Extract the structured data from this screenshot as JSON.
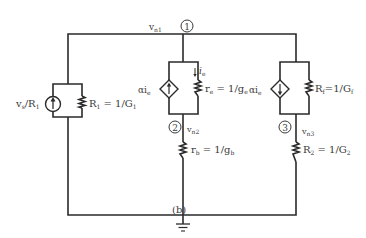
{
  "figure": {
    "caption": "(b)"
  },
  "nodes": [
    {
      "id": "1",
      "marker": "1",
      "voltage_label": "v",
      "voltage_sub": "n1"
    },
    {
      "id": "2",
      "marker": "2",
      "voltage_label": "v",
      "voltage_sub": "n2"
    },
    {
      "id": "3",
      "marker": "3",
      "voltage_label": "v",
      "voltage_sub": "n3"
    }
  ],
  "components": {
    "source_in": {
      "label": "v",
      "label_sub": "s",
      "label_rest": "/R",
      "label_rest_sub": "1"
    },
    "r1": {
      "label": "R",
      "label_sub": "1",
      "eq": " = 1/G",
      "eq_sub": "1"
    },
    "dep_source_mid": {
      "label": "αi",
      "label_sub": "e"
    },
    "re": {
      "label": "r",
      "label_sub": "e",
      "eq": " = 1/g",
      "eq_sub": "e"
    },
    "ie_current": {
      "label": "i",
      "label_sub": "e"
    },
    "rb": {
      "label": "r",
      "label_sub": "b",
      "eq": " = 1/g",
      "eq_sub": "b"
    },
    "dep_source_right": {
      "label": "αi",
      "label_sub": "e"
    },
    "rf": {
      "label": "R",
      "label_sub": "f",
      "eq": "=1/G",
      "eq_sub": "f"
    },
    "r2": {
      "label": "R",
      "label_sub": "2",
      "eq": " = 1/G",
      "eq_sub": "2"
    }
  },
  "icons": {
    "ground": "ground-icon",
    "independent_source": "current-source-icon",
    "dependent_source": "dependent-current-source-icon",
    "resistor": "resistor-icon"
  }
}
